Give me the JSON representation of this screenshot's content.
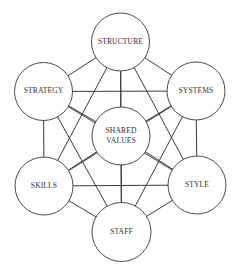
{
  "diagram": {
    "title": "",
    "type": "complete-graph",
    "nodes": [
      {
        "id": "structure",
        "lines": [
          "STRUCTURE"
        ],
        "cx": 120.5,
        "cy": 42,
        "r": 29
      },
      {
        "id": "strategy",
        "lines": [
          "STRATEGY"
        ],
        "cx": 43.5,
        "cy": 91.5,
        "r": 29
      },
      {
        "id": "systems",
        "lines": [
          "SYSTEMS"
        ],
        "cx": 196,
        "cy": 91,
        "r": 29
      },
      {
        "id": "shared-values",
        "lines": [
          "SHARED",
          "VALUES"
        ],
        "cx": 121,
        "cy": 136,
        "r": 29
      },
      {
        "id": "skills",
        "lines": [
          "SKILLS"
        ],
        "cx": 44,
        "cy": 186,
        "r": 29
      },
      {
        "id": "style",
        "lines": [
          "STYLE"
        ],
        "cx": 197,
        "cy": 185,
        "r": 29
      },
      {
        "id": "staff",
        "lines": [
          "STAFF"
        ],
        "cx": 121.5,
        "cy": 232,
        "r": 29.5
      }
    ],
    "edges": "all-pairs"
  }
}
